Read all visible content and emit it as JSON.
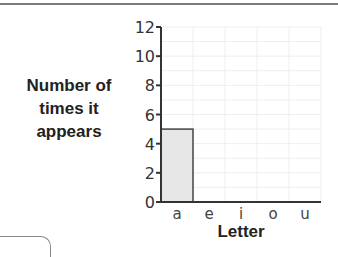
{
  "chart_data": {
    "type": "bar",
    "title": "",
    "xlabel": "Letter",
    "ylabel": "Number of times it appears",
    "ylabel_lines": [
      "Number of",
      "times it",
      "appears"
    ],
    "categories": [
      "a",
      "e",
      "i",
      "o",
      "u"
    ],
    "values": [
      5,
      0,
      0,
      0,
      0
    ],
    "ylim": [
      0,
      12
    ],
    "yticks": [
      0,
      2,
      4,
      6,
      8,
      10,
      12
    ],
    "grid": true,
    "legend": null,
    "bar_color": "#e6e6e6",
    "bar_edge_color": "#444444"
  }
}
